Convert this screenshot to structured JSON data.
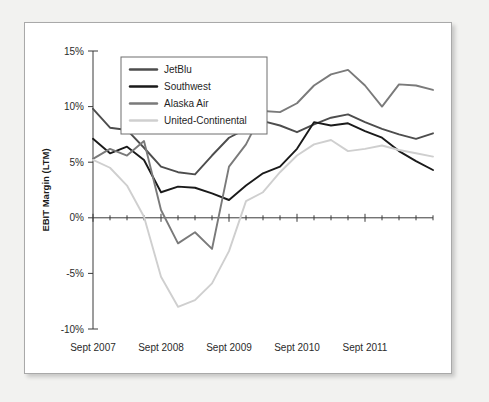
{
  "figure": {
    "background_color": "#ffffff",
    "border_color": "#a9a9a9"
  },
  "chart_data": {
    "type": "line",
    "title": "",
    "xlabel": "",
    "ylabel": "EBIT Margin (LTM)",
    "ylim": [
      -10,
      15
    ],
    "xlim": [
      0,
      20
    ],
    "grid": false,
    "legend_position": "top-left",
    "ytick_labels": [
      "15%",
      "10%",
      "5%",
      "0%",
      "-5%",
      "-10%"
    ],
    "ytick_values": [
      15,
      10,
      5,
      0,
      -5,
      -10
    ],
    "xtick_labels": [
      "Sept 2007",
      "Sept 2008",
      "Sept 2009",
      "Sept 2010",
      "Sept 2011"
    ],
    "xtick_values": [
      0,
      4,
      8,
      12,
      16
    ],
    "x": [
      0,
      1,
      2,
      3,
      4,
      5,
      6,
      7,
      8,
      9,
      10,
      11,
      12,
      13,
      14,
      15,
      16,
      17,
      18,
      19,
      20
    ],
    "series": [
      {
        "name": "JetBlu",
        "color": "#4d4d4d",
        "values": [
          9.8,
          8.1,
          7.9,
          6.3,
          4.6,
          4.1,
          3.9,
          5.6,
          7.2,
          8.0,
          8.7,
          8.3,
          7.7,
          8.4,
          9.0,
          9.3,
          8.6,
          8.0,
          7.5,
          7.1,
          7.6
        ]
      },
      {
        "name": "Southwest",
        "color": "#1a1a1a",
        "values": [
          7.1,
          5.8,
          6.4,
          5.2,
          2.3,
          2.8,
          2.7,
          2.2,
          1.6,
          2.9,
          4.0,
          4.6,
          6.2,
          8.6,
          8.3,
          8.5,
          7.8,
          7.2,
          6.0,
          5.1,
          4.3
        ]
      },
      {
        "name": "Alaska Air",
        "color": "#7a7a7a",
        "values": [
          5.3,
          6.2,
          5.6,
          6.9,
          0.7,
          -2.3,
          -1.3,
          -2.8,
          4.6,
          6.6,
          9.6,
          9.5,
          10.3,
          11.9,
          12.9,
          13.3,
          11.9,
          10.0,
          12.0,
          11.9,
          11.5
        ]
      },
      {
        "name": "United-Continental",
        "color": "#cfcfcf",
        "values": [
          5.2,
          4.5,
          2.9,
          0.1,
          -5.3,
          -8.0,
          -7.4,
          -5.9,
          -3.0,
          1.5,
          2.3,
          4.1,
          5.6,
          6.6,
          7.0,
          6.0,
          6.2,
          6.5,
          6.1,
          5.8,
          5.5
        ]
      }
    ]
  },
  "legend": {
    "items": [
      {
        "label": "JetBlu",
        "color": "#4d4d4d"
      },
      {
        "label": "Southwest",
        "color": "#1a1a1a"
      },
      {
        "label": "Alaska Air",
        "color": "#7a7a7a"
      },
      {
        "label": "United-Continental",
        "color": "#cfcfcf"
      }
    ]
  }
}
